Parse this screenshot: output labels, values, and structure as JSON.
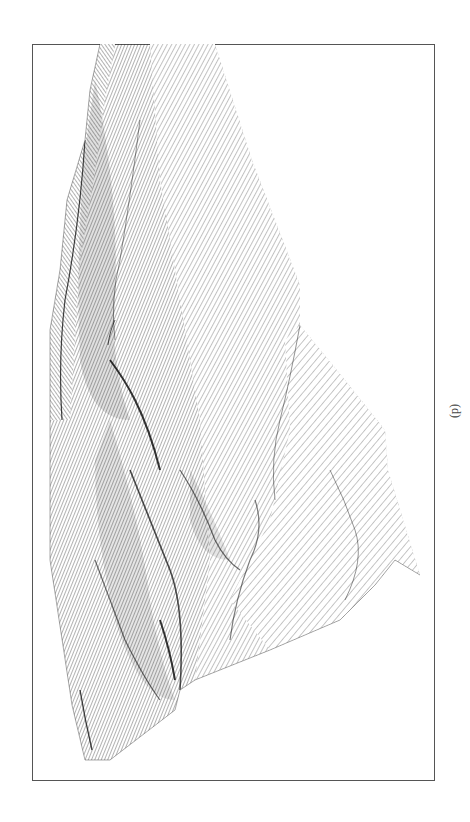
{
  "figure": {
    "caption": "(d)",
    "line_color": "#222222",
    "frame_color": "#555555",
    "background": "#ffffff"
  }
}
